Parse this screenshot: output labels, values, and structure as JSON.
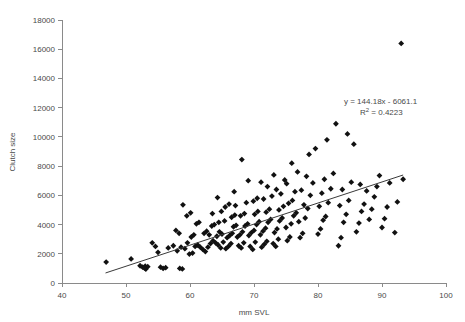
{
  "chart_data": {
    "type": "scatter",
    "title": "",
    "xlabel": "mm SVL",
    "ylabel": "Clutch size",
    "xlim": [
      40,
      100
    ],
    "ylim": [
      0,
      18000
    ],
    "xticks": [
      40,
      50,
      60,
      70,
      80,
      90,
      100
    ],
    "yticks": [
      0,
      2000,
      4000,
      6000,
      8000,
      10000,
      12000,
      14000,
      16000,
      18000
    ],
    "grid": false,
    "legend": null,
    "marker": "diamond",
    "marker_color": "#111111",
    "annotations": [
      {
        "text": "y = 144.18x - 6061.1",
        "x": 83.5,
        "y": 11250
      },
      {
        "text": "R² = 0.4223",
        "x": 84.5,
        "y": 10500
      }
    ],
    "trendline": {
      "type": "linear",
      "slope": 144.18,
      "intercept": -6061.1,
      "equation": "y = 144.18x - 6061.1",
      "r_squared": 0.4223,
      "x_start": 46.8,
      "x_end": 93.3
    },
    "series": [
      {
        "name": "Clutch size vs SVL",
        "points": [
          [
            46.9,
            1430
          ],
          [
            50.8,
            1650
          ],
          [
            52.2,
            1180
          ],
          [
            52.6,
            1080
          ],
          [
            53.0,
            1150
          ],
          [
            53.4,
            1120
          ],
          [
            53.1,
            950
          ],
          [
            52.9,
            1020
          ],
          [
            55.4,
            1080
          ],
          [
            55.8,
            1000
          ],
          [
            56.2,
            1050
          ],
          [
            58.4,
            1000
          ],
          [
            58.8,
            960
          ],
          [
            55.0,
            2100
          ],
          [
            56.6,
            2400
          ],
          [
            57.4,
            2550
          ],
          [
            58.0,
            2200
          ],
          [
            58.6,
            2450
          ],
          [
            59.2,
            2350
          ],
          [
            59.6,
            2750
          ],
          [
            54.1,
            2750
          ],
          [
            54.6,
            2500
          ],
          [
            57.8,
            3600
          ],
          [
            58.3,
            3400
          ],
          [
            59.9,
            1980
          ],
          [
            60.4,
            2050
          ],
          [
            60.8,
            2500
          ],
          [
            61.2,
            2600
          ],
          [
            61.6,
            2450
          ],
          [
            60.2,
            3150
          ],
          [
            60.6,
            3300
          ],
          [
            61.0,
            4050
          ],
          [
            61.4,
            4150
          ],
          [
            59.5,
            4600
          ],
          [
            60.1,
            4800
          ],
          [
            58.9,
            5350
          ],
          [
            62.0,
            2300
          ],
          [
            62.4,
            2150
          ],
          [
            62.8,
            2450
          ],
          [
            63.2,
            2700
          ],
          [
            63.6,
            2900
          ],
          [
            64.0,
            2750
          ],
          [
            62.2,
            3400
          ],
          [
            62.6,
            3550
          ],
          [
            63.0,
            3300
          ],
          [
            63.4,
            3900
          ],
          [
            63.8,
            4000
          ],
          [
            64.4,
            2600
          ],
          [
            64.8,
            2400
          ],
          [
            65.2,
            2800
          ],
          [
            64.2,
            3200
          ],
          [
            64.6,
            3500
          ],
          [
            65.0,
            3350
          ],
          [
            64.5,
            4150
          ],
          [
            65.4,
            4250
          ],
          [
            63.5,
            4750
          ],
          [
            64.9,
            4900
          ],
          [
            65.6,
            2350
          ],
          [
            66.0,
            2500
          ],
          [
            66.4,
            2700
          ],
          [
            65.8,
            3100
          ],
          [
            66.2,
            3250
          ],
          [
            66.6,
            3400
          ],
          [
            66.8,
            3850
          ],
          [
            67.2,
            3950
          ],
          [
            66.5,
            4500
          ],
          [
            67.0,
            4650
          ],
          [
            65.5,
            5200
          ],
          [
            66.1,
            5400
          ],
          [
            64.3,
            5850
          ],
          [
            67.6,
            2550
          ],
          [
            68.0,
            2400
          ],
          [
            68.4,
            2750
          ],
          [
            67.4,
            3150
          ],
          [
            67.8,
            3300
          ],
          [
            68.2,
            3500
          ],
          [
            68.6,
            3900
          ],
          [
            69.0,
            4050
          ],
          [
            67.9,
            4600
          ],
          [
            68.5,
            4750
          ],
          [
            67.1,
            5300
          ],
          [
            68.8,
            5500
          ],
          [
            66.9,
            6250
          ],
          [
            69.4,
            2500
          ],
          [
            69.8,
            2300
          ],
          [
            70.2,
            2800
          ],
          [
            69.2,
            3250
          ],
          [
            69.6,
            3450
          ],
          [
            70.0,
            3600
          ],
          [
            70.4,
            4000
          ],
          [
            70.8,
            4200
          ],
          [
            70.1,
            4700
          ],
          [
            70.6,
            4900
          ],
          [
            69.9,
            5600
          ],
          [
            70.5,
            5800
          ],
          [
            68.1,
            8450
          ],
          [
            69.1,
            7000
          ],
          [
            71.2,
            2450
          ],
          [
            71.6,
            2650
          ],
          [
            72.0,
            2850
          ],
          [
            71.0,
            3300
          ],
          [
            71.4,
            3550
          ],
          [
            71.8,
            3750
          ],
          [
            72.2,
            4150
          ],
          [
            72.6,
            4350
          ],
          [
            71.9,
            4850
          ],
          [
            72.4,
            5050
          ],
          [
            71.5,
            5750
          ],
          [
            72.8,
            5950
          ],
          [
            72.1,
            6600
          ],
          [
            71.1,
            6900
          ],
          [
            73.0,
            2700
          ],
          [
            73.4,
            2500
          ],
          [
            73.8,
            3000
          ],
          [
            73.2,
            3450
          ],
          [
            73.6,
            3700
          ],
          [
            74.0,
            4250
          ],
          [
            74.4,
            4450
          ],
          [
            73.9,
            5000
          ],
          [
            74.6,
            5250
          ],
          [
            74.2,
            6100
          ],
          [
            73.5,
            6400
          ],
          [
            74.8,
            7050
          ],
          [
            73.1,
            7400
          ],
          [
            75.2,
            2900
          ],
          [
            75.6,
            3150
          ],
          [
            75.0,
            3800
          ],
          [
            75.8,
            4050
          ],
          [
            76.2,
            4600
          ],
          [
            76.6,
            4800
          ],
          [
            75.4,
            5450
          ],
          [
            76.0,
            5650
          ],
          [
            76.4,
            6250
          ],
          [
            75.1,
            6800
          ],
          [
            76.8,
            7600
          ],
          [
            75.9,
            8200
          ],
          [
            77.2,
            3100
          ],
          [
            77.6,
            3400
          ],
          [
            77.0,
            4200
          ],
          [
            78.0,
            4450
          ],
          [
            78.4,
            5100
          ],
          [
            77.8,
            5350
          ],
          [
            78.8,
            6000
          ],
          [
            77.4,
            6350
          ],
          [
            79.2,
            6850
          ],
          [
            78.2,
            7300
          ],
          [
            79.6,
            9200
          ],
          [
            78.6,
            8800
          ],
          [
            80.0,
            3350
          ],
          [
            80.4,
            3700
          ],
          [
            80.8,
            4300
          ],
          [
            81.2,
            4550
          ],
          [
            80.2,
            5250
          ],
          [
            81.6,
            5500
          ],
          [
            80.6,
            6150
          ],
          [
            82.0,
            6450
          ],
          [
            81.0,
            7100
          ],
          [
            82.4,
            7500
          ],
          [
            81.4,
            9800
          ],
          [
            82.8,
            10900
          ],
          [
            83.2,
            2550
          ],
          [
            83.6,
            3100
          ],
          [
            84.0,
            4150
          ],
          [
            84.4,
            4700
          ],
          [
            83.4,
            5300
          ],
          [
            84.8,
            5650
          ],
          [
            83.8,
            6400
          ],
          [
            85.2,
            6900
          ],
          [
            85.6,
            9500
          ],
          [
            84.6,
            10200
          ],
          [
            86.0,
            3500
          ],
          [
            86.4,
            4100
          ],
          [
            86.8,
            4900
          ],
          [
            87.2,
            5400
          ],
          [
            87.6,
            6300
          ],
          [
            86.6,
            6750
          ],
          [
            88.0,
            4350
          ],
          [
            88.4,
            5050
          ],
          [
            88.8,
            5900
          ],
          [
            89.2,
            6600
          ],
          [
            90.0,
            3800
          ],
          [
            90.4,
            4400
          ],
          [
            90.8,
            5200
          ],
          [
            91.2,
            6850
          ],
          [
            92.0,
            3450
          ],
          [
            92.4,
            5550
          ],
          [
            93.3,
            7100
          ],
          [
            89.6,
            7350
          ],
          [
            93.0,
            16400
          ]
        ]
      }
    ]
  }
}
